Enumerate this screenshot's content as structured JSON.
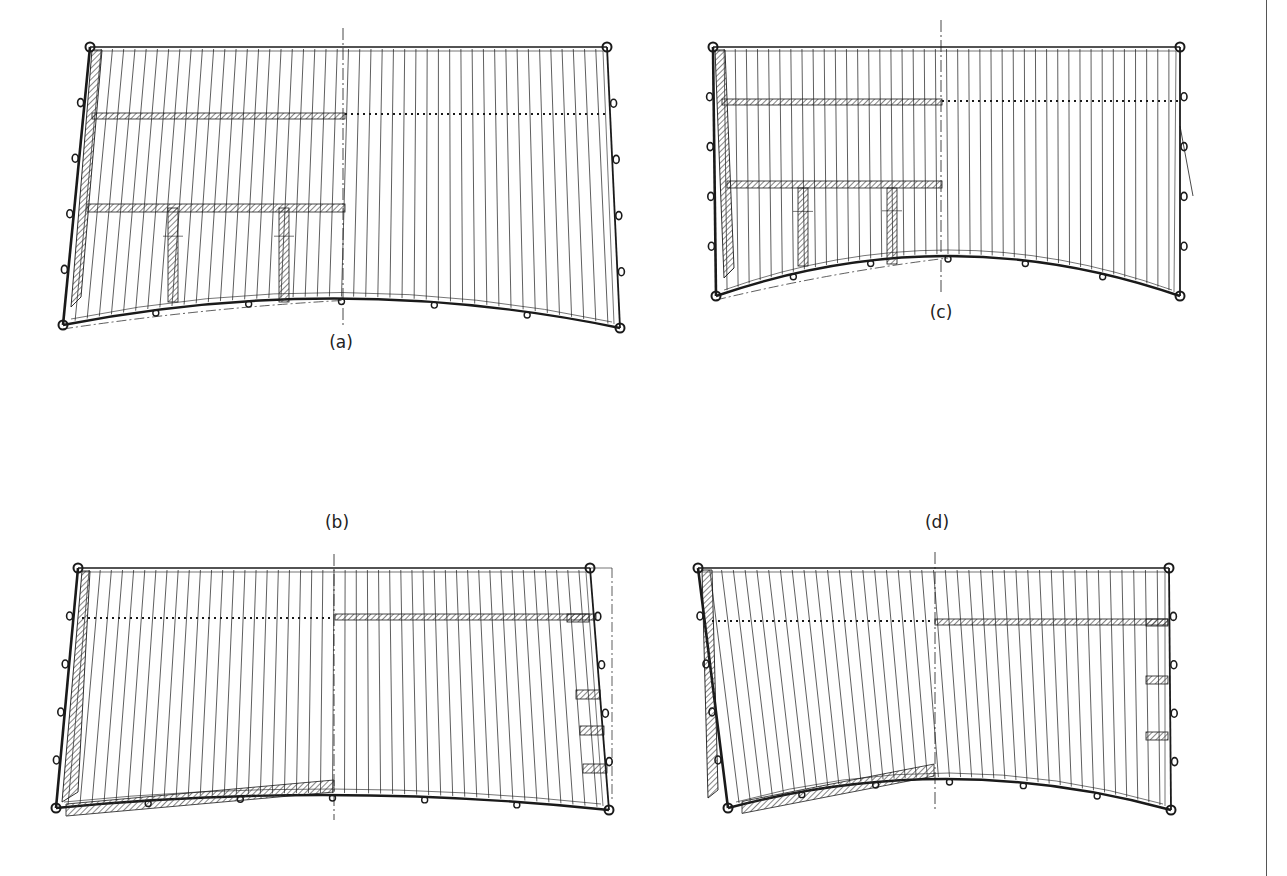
{
  "figure": {
    "panels": [
      {
        "id": "a",
        "label": "(a)",
        "label_pos": [
          341,
          344
        ],
        "top_left": [
          90,
          47
        ],
        "top_right": [
          607,
          47
        ],
        "bottom_left": [
          63,
          325
        ],
        "bottom_right": [
          620,
          328
        ],
        "bottom_sag": 28,
        "centerline_x": 343,
        "centerline_range": [
          28,
          326
        ],
        "battens_count": 46,
        "left_strip": "hatched-wide",
        "bars": [
          {
            "x1": 92,
            "x2": 345,
            "y": 113,
            "h": 6
          },
          {
            "x1": 87,
            "x2": 345,
            "y": 204,
            "h": 8
          }
        ],
        "dotted_lines": [
          {
            "x1": 345,
            "x2": 607,
            "y": 114
          }
        ],
        "posts": [
          {
            "x": 173,
            "y1": 208,
            "y2": 302,
            "w": 10
          },
          {
            "x": 284,
            "y1": 208,
            "y2": 302,
            "w": 10
          }
        ],
        "side_boxes": [],
        "bottom_band": null,
        "dashdot_curve": true
      },
      {
        "id": "c",
        "label": "(c)",
        "label_pos": [
          941,
          314
        ],
        "top_left": [
          713,
          47
        ],
        "top_right": [
          1180,
          47
        ],
        "bottom_left": [
          716,
          296
        ],
        "bottom_right": [
          1180,
          296
        ],
        "bottom_sag": 40,
        "centerline_x": 941,
        "centerline_range": [
          20,
          295
        ],
        "battens_count": 42,
        "left_strip": "hatched-wide",
        "bars": [
          {
            "x1": 722,
            "x2": 942,
            "y": 99,
            "h": 6
          },
          {
            "x1": 727,
            "x2": 942,
            "y": 181,
            "h": 7
          }
        ],
        "dotted_lines": [
          {
            "x1": 942,
            "x2": 1180,
            "y": 101
          }
        ],
        "posts": [
          {
            "x": 803,
            "y1": 188,
            "y2": 266,
            "w": 10
          },
          {
            "x": 892,
            "y1": 188,
            "y2": 264,
            "w": 10
          }
        ],
        "side_boxes": [],
        "bottom_band": null,
        "dashdot_curve": true,
        "rope_line": [
          [
            1180,
            126
          ],
          [
            1193,
            196
          ]
        ]
      },
      {
        "id": "b",
        "label": "(b)",
        "label_pos": [
          337,
          524
        ],
        "top_left": [
          78,
          568
        ],
        "top_right": [
          590,
          568
        ],
        "bottom_left": [
          56,
          808
        ],
        "bottom_right": [
          609,
          810
        ],
        "bottom_sag": 14,
        "centerline_x": 334,
        "centerline_range": [
          554,
          820
        ],
        "battens_count": 46,
        "left_strip": "hatched-slant",
        "bars": [
          {
            "x1": 335,
            "x2": 596,
            "y": 614,
            "h": 6
          }
        ],
        "dotted_lines": [
          {
            "x1": 82,
            "x2": 334,
            "y": 618
          }
        ],
        "posts": [],
        "side_boxes": [
          {
            "x": 567,
            "y": 614,
            "w": 22,
            "h": 8
          },
          {
            "x": 576,
            "y": 690,
            "w": 24,
            "h": 9
          },
          {
            "x": 580,
            "y": 726,
            "w": 24,
            "h": 9
          },
          {
            "x": 583,
            "y": 764,
            "w": 24,
            "h": 9
          }
        ],
        "bottom_band": {
          "x1": 66,
          "x2": 334,
          "y": 785,
          "h": 12
        },
        "dashdot_curve": false,
        "dashdot_vertical": {
          "x": 612,
          "y1": 568,
          "y2": 800
        }
      },
      {
        "id": "d",
        "label": "(d)",
        "label_pos": [
          937,
          524
        ],
        "top_left": [
          698,
          568
        ],
        "top_right": [
          1169,
          568
        ],
        "bottom_left": [
          728,
          808
        ],
        "bottom_right": [
          1171,
          810
        ],
        "bottom_sag": 30,
        "centerline_x": 935,
        "centerline_range": [
          552,
          810
        ],
        "battens_count": 40,
        "left_strip": "hatched-taper",
        "bars": [
          {
            "x1": 935,
            "x2": 1168,
            "y": 619,
            "h": 6
          }
        ],
        "dotted_lines": [
          {
            "x1": 712,
            "x2": 934,
            "y": 621
          }
        ],
        "posts": [],
        "side_boxes": [
          {
            "x": 1146,
            "y": 619,
            "w": 22,
            "h": 7
          },
          {
            "x": 1146,
            "y": 676,
            "w": 22,
            "h": 8
          },
          {
            "x": 1146,
            "y": 732,
            "w": 22,
            "h": 8
          }
        ],
        "bottom_band": {
          "x1": 742,
          "x2": 934,
          "y": 776,
          "h": 12
        },
        "dashdot_curve": false
      }
    ],
    "colors": {
      "ink": "#1a1a1a",
      "hatch": "#333333",
      "paper": "#ffffff"
    }
  }
}
